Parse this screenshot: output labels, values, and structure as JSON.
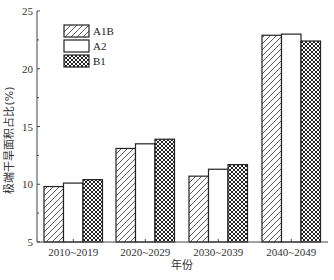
{
  "chart_data": {
    "type": "bar",
    "title": "",
    "xlabel": "年份",
    "ylabel": "极端干旱面积占比(%)",
    "ylim": [
      5,
      25
    ],
    "yticks": [
      5,
      10,
      15,
      20,
      25
    ],
    "grid": false,
    "legend_position": "upper-left",
    "categories": [
      "2010~2019",
      "2020~2029",
      "2030~2039",
      "2040~2049"
    ],
    "series": [
      {
        "name": "A1B",
        "pattern": "diagonal-hatch",
        "values": [
          9.8,
          13.1,
          10.7,
          22.9
        ]
      },
      {
        "name": "A2",
        "pattern": "blank",
        "values": [
          10.1,
          13.5,
          11.3,
          23.0
        ]
      },
      {
        "name": "B1",
        "pattern": "cross-hatch",
        "values": [
          10.4,
          13.9,
          11.7,
          22.4
        ]
      }
    ]
  },
  "colors": {
    "axis": "#444444",
    "bar_stroke": "#222222",
    "bar_fill": "#ffffff"
  }
}
